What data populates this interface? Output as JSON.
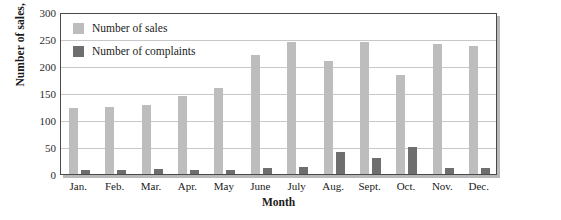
{
  "chart_data": {
    "type": "bar",
    "title": "",
    "xlabel": "Month",
    "ylabel": "Number of sales, complaints",
    "ylim": [
      0,
      300
    ],
    "ytick_step": 50,
    "yticks": [
      "0",
      "50",
      "100",
      "150",
      "200",
      "250",
      "300"
    ],
    "grid": "horizontal",
    "legend_position": "top-left-inside",
    "categories": [
      "Jan.",
      "Feb.",
      "Mar.",
      "Apr.",
      "May",
      "June",
      "July",
      "Aug.",
      "Sept.",
      "Oct.",
      "Nov.",
      "Dec."
    ],
    "series": [
      {
        "name": "Number of sales",
        "color": "#bdbdbd",
        "values": [
          122,
          124,
          128,
          144,
          159,
          220,
          245,
          210,
          245,
          183,
          240,
          237
        ]
      },
      {
        "name": "Number of complaints",
        "color": "#6e6e6e",
        "values": [
          8,
          7,
          9,
          7,
          8,
          12,
          13,
          40,
          30,
          50,
          11,
          12
        ]
      }
    ]
  },
  "colors": {
    "sales": "#bdbdbd",
    "complaints": "#6e6e6e",
    "axis": "#4a4a4a",
    "gridline": "#c8c8c8",
    "shadow": "#b9b9b9",
    "text": "#1a1a1a"
  }
}
